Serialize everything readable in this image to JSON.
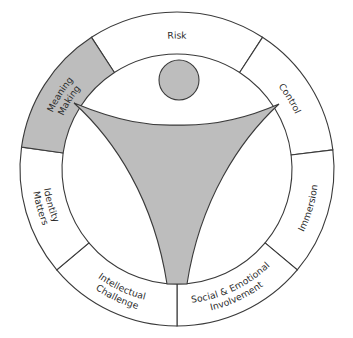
{
  "diagram": {
    "center": {
      "x": 177,
      "y": 169
    },
    "outer_radius": 157,
    "inner_radius": 115,
    "colors": {
      "stroke": "#3a3a3a",
      "highlight_fill": "#bdbdbd",
      "figure_fill": "#bdbdbd",
      "segment_fill": "#ffffff"
    },
    "segments": [
      {
        "id": "risk",
        "lines": [
          "Risk"
        ],
        "start": -33,
        "end": 33,
        "highlighted": false
      },
      {
        "id": "control",
        "lines": [
          "Control"
        ],
        "start": 33,
        "end": 83,
        "highlighted": false
      },
      {
        "id": "immersion",
        "lines": [
          "Immersion"
        ],
        "start": 83,
        "end": 130,
        "highlighted": false
      },
      {
        "id": "social-emotional-involvement",
        "lines": [
          "Social & Emotional",
          "Involvement"
        ],
        "start": 130,
        "end": 180,
        "highlighted": false
      },
      {
        "id": "intellectual-challenge",
        "lines": [
          "Intellectual",
          "Challenge"
        ],
        "start": 180,
        "end": 230,
        "highlighted": false
      },
      {
        "id": "identity-matters",
        "lines": [
          "Identity",
          "Matters"
        ],
        "start": 230,
        "end": 278,
        "highlighted": false
      },
      {
        "id": "meaning-making",
        "lines": [
          "Meaning",
          "Making"
        ],
        "start": 278,
        "end": 327,
        "highlighted": true
      }
    ],
    "figure": {
      "head": {
        "cx": 179,
        "cy": 80,
        "r": 20
      }
    }
  }
}
